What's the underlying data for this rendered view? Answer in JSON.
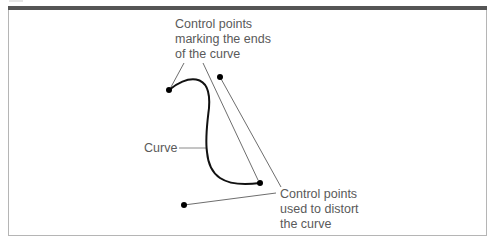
{
  "figure": {
    "labels": {
      "end_points": [
        "Control points",
        "marking the ends",
        "of the curve"
      ],
      "curve": "Curve",
      "distort_points": [
        "Control points",
        "used to distort",
        "the curve"
      ]
    },
    "colors": {
      "frame_top_bar": "#555555",
      "frame_border": "#b5b5b5",
      "curve": "#111111",
      "leader_lines": "#6e6e6e",
      "label_text": "#5a5a5a"
    },
    "points": {
      "end_start": [
        169,
        90
      ],
      "end_finish": [
        260,
        183
      ],
      "distort_1": [
        220,
        77
      ],
      "distort_2": [
        184,
        205
      ]
    }
  }
}
